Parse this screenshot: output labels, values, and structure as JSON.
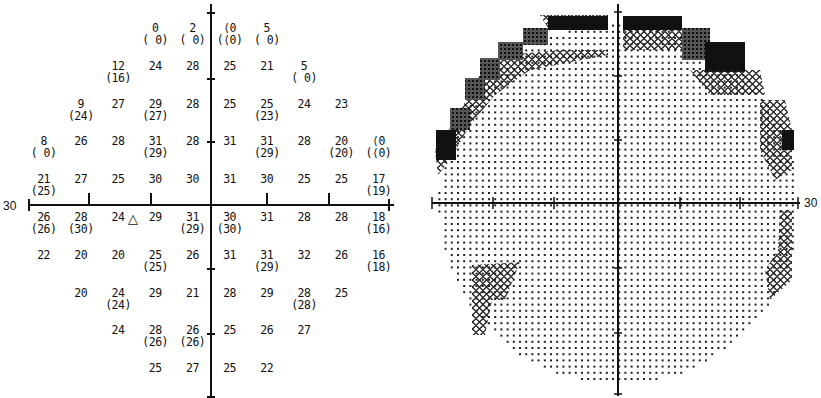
{
  "chart_data": [
    {
      "type": "table",
      "title": "Numeric threshold values (dB) — 30-2 visual field",
      "grid_spacing_deg": 6,
      "axis_label": "30",
      "notes": "Top value = threshold (dB); parenthesized value = repeated test. '<0' shown as ⟨0. Triangle marks blind spot.",
      "rows": [
        {
          "y_deg": 27,
          "cells": [
            {
              "x_deg": -9,
              "val": "0",
              "rep": "( 0)"
            },
            {
              "x_deg": -3,
              "val": "2",
              "rep": "( 0)"
            },
            {
              "x_deg": 3,
              "val": "⟨0",
              "rep": "(⟨0)"
            },
            {
              "x_deg": 9,
              "val": "5",
              "rep": "( 0)"
            }
          ]
        },
        {
          "y_deg": 21,
          "cells": [
            {
              "x_deg": -15,
              "val": "12",
              "rep": "(16)"
            },
            {
              "x_deg": -9,
              "val": "24",
              "rep": ""
            },
            {
              "x_deg": -3,
              "val": "28",
              "rep": ""
            },
            {
              "x_deg": 3,
              "val": "25",
              "rep": ""
            },
            {
              "x_deg": 9,
              "val": "21",
              "rep": ""
            },
            {
              "x_deg": 15,
              "val": "5",
              "rep": "( 0)"
            }
          ]
        },
        {
          "y_deg": 15,
          "cells": [
            {
              "x_deg": -21,
              "val": "9",
              "rep": "(24)"
            },
            {
              "x_deg": -15,
              "val": "27",
              "rep": ""
            },
            {
              "x_deg": -9,
              "val": "29",
              "rep": "(27)"
            },
            {
              "x_deg": -3,
              "val": "28",
              "rep": ""
            },
            {
              "x_deg": 3,
              "val": "25",
              "rep": ""
            },
            {
              "x_deg": 9,
              "val": "25",
              "rep": "(23)"
            },
            {
              "x_deg": 15,
              "val": "24",
              "rep": ""
            },
            {
              "x_deg": 21,
              "val": "23",
              "rep": ""
            }
          ]
        },
        {
          "y_deg": 9,
          "cells": [
            {
              "x_deg": -27,
              "val": "8",
              "rep": "( 0)"
            },
            {
              "x_deg": -21,
              "val": "26",
              "rep": ""
            },
            {
              "x_deg": -15,
              "val": "28",
              "rep": ""
            },
            {
              "x_deg": -9,
              "val": "31",
              "rep": "(29)"
            },
            {
              "x_deg": -3,
              "val": "28",
              "rep": ""
            },
            {
              "x_deg": 3,
              "val": "31",
              "rep": ""
            },
            {
              "x_deg": 9,
              "val": "31",
              "rep": "(29)"
            },
            {
              "x_deg": 15,
              "val": "28",
              "rep": ""
            },
            {
              "x_deg": 21,
              "val": "20",
              "rep": "(20)"
            },
            {
              "x_deg": 27,
              "val": "⟨0",
              "rep": "(⟨0)"
            }
          ]
        },
        {
          "y_deg": 3,
          "cells": [
            {
              "x_deg": -27,
              "val": "21",
              "rep": "(25)"
            },
            {
              "x_deg": -21,
              "val": "27",
              "rep": ""
            },
            {
              "x_deg": -15,
              "val": "25",
              "rep": ""
            },
            {
              "x_deg": -9,
              "val": "30",
              "rep": ""
            },
            {
              "x_deg": -3,
              "val": "30",
              "rep": ""
            },
            {
              "x_deg": 3,
              "val": "31",
              "rep": ""
            },
            {
              "x_deg": 9,
              "val": "30",
              "rep": ""
            },
            {
              "x_deg": 15,
              "val": "25",
              "rep": ""
            },
            {
              "x_deg": 21,
              "val": "25",
              "rep": ""
            },
            {
              "x_deg": 27,
              "val": "17",
              "rep": "(19)"
            }
          ]
        },
        {
          "y_deg": -3,
          "cells": [
            {
              "x_deg": -27,
              "val": "26",
              "rep": "(26)"
            },
            {
              "x_deg": -21,
              "val": "28",
              "rep": "(30)"
            },
            {
              "x_deg": -15,
              "val": "24",
              "rep": ""
            },
            {
              "x_deg": -9,
              "val": "29",
              "rep": ""
            },
            {
              "x_deg": -3,
              "val": "31",
              "rep": "(29)"
            },
            {
              "x_deg": 3,
              "val": "30",
              "rep": "(30)"
            },
            {
              "x_deg": 9,
              "val": "31",
              "rep": ""
            },
            {
              "x_deg": 15,
              "val": "28",
              "rep": ""
            },
            {
              "x_deg": 21,
              "val": "28",
              "rep": ""
            },
            {
              "x_deg": 27,
              "val": "18",
              "rep": "(16)"
            }
          ]
        },
        {
          "y_deg": -9,
          "cells": [
            {
              "x_deg": -27,
              "val": "22",
              "rep": ""
            },
            {
              "x_deg": -21,
              "val": "20",
              "rep": ""
            },
            {
              "x_deg": -15,
              "val": "20",
              "rep": ""
            },
            {
              "x_deg": -9,
              "val": "25",
              "rep": "(25)"
            },
            {
              "x_deg": -3,
              "val": "26",
              "rep": ""
            },
            {
              "x_deg": 3,
              "val": "31",
              "rep": ""
            },
            {
              "x_deg": 9,
              "val": "31",
              "rep": "(29)"
            },
            {
              "x_deg": 15,
              "val": "32",
              "rep": ""
            },
            {
              "x_deg": 21,
              "val": "26",
              "rep": ""
            },
            {
              "x_deg": 27,
              "val": "16",
              "rep": "(18)"
            }
          ]
        },
        {
          "y_deg": -15,
          "cells": [
            {
              "x_deg": -21,
              "val": "20",
              "rep": ""
            },
            {
              "x_deg": -15,
              "val": "24",
              "rep": "(24)"
            },
            {
              "x_deg": -9,
              "val": "29",
              "rep": ""
            },
            {
              "x_deg": -3,
              "val": "21",
              "rep": ""
            },
            {
              "x_deg": 3,
              "val": "28",
              "rep": ""
            },
            {
              "x_deg": 9,
              "val": "29",
              "rep": ""
            },
            {
              "x_deg": 15,
              "val": "28",
              "rep": "(28)"
            },
            {
              "x_deg": 21,
              "val": "25",
              "rep": ""
            }
          ]
        },
        {
          "y_deg": -21,
          "cells": [
            {
              "x_deg": -15,
              "val": "24",
              "rep": ""
            },
            {
              "x_deg": -9,
              "val": "28",
              "rep": "(26)"
            },
            {
              "x_deg": -3,
              "val": "26",
              "rep": "(26)"
            },
            {
              "x_deg": 3,
              "val": "25",
              "rep": ""
            },
            {
              "x_deg": 9,
              "val": "26",
              "rep": ""
            },
            {
              "x_deg": 15,
              "val": "27",
              "rep": ""
            }
          ]
        },
        {
          "y_deg": -27,
          "cells": [
            {
              "x_deg": -9,
              "val": "25",
              "rep": ""
            },
            {
              "x_deg": -3,
              "val": "27",
              "rep": ""
            },
            {
              "x_deg": 3,
              "val": "25",
              "rep": ""
            },
            {
              "x_deg": 9,
              "val": "22",
              "rep": ""
            }
          ]
        }
      ],
      "blind_spot": {
        "x_deg": -12,
        "y_deg": -3,
        "symbol": "△"
      }
    },
    {
      "type": "heatmap",
      "title": "Grayscale plot",
      "axis_label": "30",
      "legend": "dense black = severe loss; crosshatch = moderate; dots = normal",
      "regions": [
        {
          "area": "superior arc (upper edge, both sides)",
          "severity": "dense/black"
        },
        {
          "area": "superior-nasal ring",
          "severity": "crosshatch"
        },
        {
          "area": "temporal edge right (mid)",
          "severity": "crosshatch"
        },
        {
          "area": "inferior-left island",
          "severity": "crosshatch"
        }
      ]
    }
  ],
  "left": {
    "axis_label_left": "30",
    "blind_spot_symbol": "△"
  },
  "right": {
    "axis_label_right": "30"
  }
}
